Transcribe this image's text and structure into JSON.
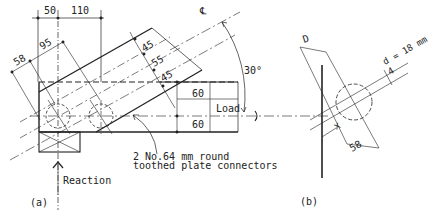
{
  "figure_a": {
    "label": "(a)",
    "top_dims": [
      "50",
      "110"
    ],
    "diag_dims_left": [
      "58",
      "95"
    ],
    "diag_dims_right": [
      "45",
      "55",
      "45"
    ],
    "side_dims": [
      "60",
      "60"
    ],
    "angle": "30°",
    "load_label": "Load",
    "reaction_label": "Reaction",
    "centerline_symbol": "℄",
    "note_line1": "2 No.64 mm round",
    "note_line2": "toothed plate connectors"
  },
  "figure_b": {
    "label": "(b)",
    "dim_D": "D",
    "dim_d_num": "d",
    "dim_d_den": "4",
    "dim_d_value": "= 18 mm",
    "dim_x": "x",
    "dim_58": "58"
  }
}
